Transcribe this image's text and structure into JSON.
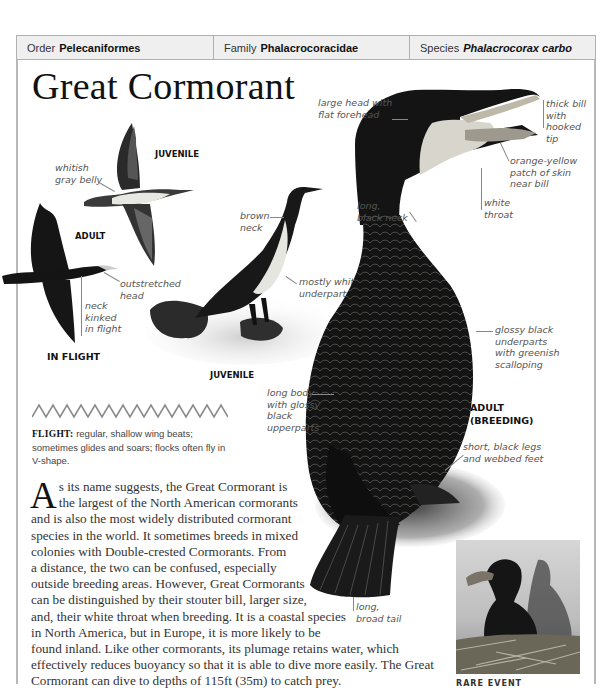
{
  "taxonomy": {
    "order": {
      "label": "Order",
      "value": "Pelecaniformes"
    },
    "family": {
      "label": "Family",
      "value": "Phalacrocoracidae"
    },
    "species": {
      "label": "Species",
      "value": "Phalacrocorax carbo"
    }
  },
  "title": "Great Cormorant",
  "in_flight": {
    "heading": "IN FLIGHT",
    "juvenile_tag": "JUVENILE",
    "adult_tag": "ADULT",
    "labels": {
      "whitish_belly": [
        "whitish",
        "gray belly"
      ],
      "outstretched_head": [
        "outstretched",
        "head"
      ],
      "neck_kinked": [
        "neck",
        "kinked",
        "in flight"
      ]
    }
  },
  "juvenile_standing": {
    "tag": "JUVENILE",
    "labels": {
      "brown_neck": [
        "brown",
        "neck"
      ],
      "mostly_white": [
        "mostly white",
        "underparts"
      ]
    }
  },
  "adult_breeding": {
    "tag": [
      "ADULT",
      "(BREEDING)"
    ],
    "labels": {
      "large_head": [
        "large head with",
        "flat forehead"
      ],
      "thick_bill": [
        "thick bill",
        "with",
        "hooked",
        "tip"
      ],
      "orange_patch": [
        "orange-yellow",
        "patch of skin",
        "near bill"
      ],
      "white_throat": [
        "white",
        "throat"
      ],
      "long_neck": [
        "long,",
        "black neck"
      ],
      "glossy_underparts": [
        "glossy black",
        "underparts",
        "with greenish",
        "scalloping"
      ],
      "long_body": [
        "long body",
        "with glossy",
        "black",
        "upperparts"
      ],
      "short_legs": [
        "short, black legs",
        "and webbed feet"
      ],
      "long_tail": [
        "long,",
        "broad tail"
      ]
    }
  },
  "flight_note": {
    "label": "FLIGHT:",
    "text": "regular, shallow wing beats; sometimes glides and soars; flocks often fly in V-shape."
  },
  "body": {
    "dropcap": "A",
    "lines": [
      "s its name suggests, the Great Cormorant is",
      "the largest of the North American cormorants",
      "and is also the most widely distributed cormorant",
      "species in the world. It sometimes breeds in mixed",
      "colonies with Double-crested Cormorants. From",
      "a distance, the two can be confused, especially",
      "outside breeding areas. However, Great Cormorants",
      "can be distinguished by their stouter bill, larger size,",
      "and, their white throat when breeding. It is a coastal species",
      "in North America, but in Europe, it is more likely to be",
      "found inland. Like other cormorants, its plumage retains water, which",
      "effectively reduces buoyancy so that it is able to dive more easily. The Great",
      "Cormorant can dive to depths of 115ft (35m) to catch prey."
    ]
  },
  "photo": {
    "caption": "RARE EVENT"
  },
  "colors": {
    "header_bg": "#efefef",
    "frame": "#b8b8b8",
    "label_text": "#555555",
    "bird_black": "#111111"
  }
}
